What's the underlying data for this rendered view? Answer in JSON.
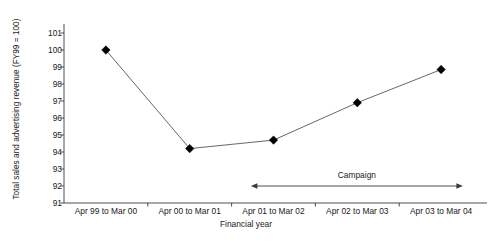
{
  "chart_data": {
    "type": "line",
    "title": "",
    "xlabel": "Financial year",
    "ylabel": "Total sales and advertising revenue (FY99 = 100)",
    "categories": [
      "Apr 99 to Mar 00",
      "Apr 00 to Mar 01",
      "Apr 01 to Mar 02",
      "Apr 02 to Mar 03",
      "Apr 03 to Mar 04"
    ],
    "values": [
      100.0,
      94.2,
      94.7,
      96.9,
      98.85
    ],
    "ylim": [
      91,
      101
    ],
    "yticks": [
      91,
      92,
      93,
      94,
      95,
      96,
      97,
      98,
      99,
      100,
      101
    ],
    "ytick_labels": [
      "91",
      "92",
      "93",
      "94",
      "95",
      "96",
      "97",
      "98",
      "99",
      "100",
      "101"
    ],
    "grid": false,
    "legend": "none",
    "marker": "diamond",
    "marker_color": "#000000",
    "line_color": "#555555",
    "annotations": [
      {
        "name": "campaign",
        "text": "Campaign",
        "arrow": "double-headed",
        "from_category": "Apr 01 to Mar 02",
        "to_category": "Apr 03 to Mar 04"
      }
    ]
  },
  "axes": {
    "y_title": "Total sales and advertising revenue (FY99 = 100)",
    "x_title": "Financial year"
  },
  "annotation": {
    "campaign_label": "Campaign"
  }
}
